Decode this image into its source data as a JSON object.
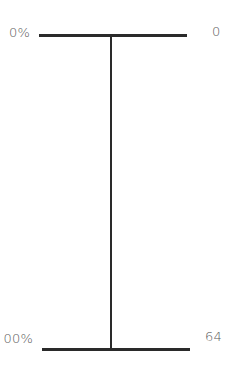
{
  "diagram": {
    "type": "vertical-range-scale",
    "top": {
      "left_label": "0%",
      "right_label": "0"
    },
    "bottom": {
      "left_label": "00%",
      "right_label": "64"
    },
    "colors": {
      "line": "#2a2a2a",
      "text": "#5a5a5a",
      "background": "#ffffff"
    }
  }
}
